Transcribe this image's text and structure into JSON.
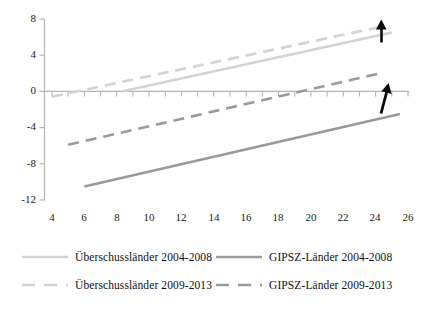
{
  "chart_data": {
    "type": "line",
    "title": "",
    "subtitle": "",
    "xlabel": "",
    "ylabel": "",
    "xlim": [
      3,
      27
    ],
    "ylim": [
      -12,
      8
    ],
    "xticks": [
      4,
      6,
      8,
      10,
      12,
      14,
      16,
      18,
      20,
      22,
      24,
      26
    ],
    "yticks": [
      8,
      4,
      0,
      -4,
      -8,
      -12
    ],
    "xtick_labels": [
      "4",
      "6",
      "8",
      "10",
      "12",
      "14",
      "16",
      "18",
      "20",
      "22",
      "24",
      "26"
    ],
    "ytick_labels": [
      "8",
      "4",
      "0",
      "-4",
      "-8",
      "-12"
    ],
    "grid": false,
    "legend_position": "bottom",
    "zero_line": true,
    "series": [
      {
        "name": "Überschussländer 2004-2008",
        "style": "solid",
        "color": "#d3d3d3",
        "x": [
          8.3,
          25.0
        ],
        "values": [
          0.0,
          6.5
        ]
      },
      {
        "name": "GIPSZ-Länder 2004-2008",
        "style": "solid",
        "color": "#9a9a9a",
        "x": [
          6.0,
          25.5
        ],
        "values": [
          -10.5,
          -2.5
        ]
      },
      {
        "name": "Überschussländer 2009-2013",
        "style": "dashed",
        "color": "#d3d3d3",
        "x": [
          4.0,
          24.5
        ],
        "values": [
          -0.6,
          7.2
        ]
      },
      {
        "name": "GIPSZ-Länder 2009-2013",
        "style": "dashed",
        "color": "#9a9a9a",
        "x": [
          5.0,
          24.5
        ],
        "values": [
          -5.9,
          2.1
        ]
      }
    ],
    "annotations": [
      {
        "name": "up-arrow-upper",
        "x": 25.7,
        "y": 6.6,
        "symbol": "↑"
      },
      {
        "name": "up-arrow-lower",
        "x": 25.3,
        "y": 0.3,
        "symbol": "↑"
      }
    ]
  },
  "legend": {
    "rows": [
      [
        {
          "label": "Überschussländer 2004-2008",
          "style": "solid",
          "color": "#d3d3d3"
        },
        {
          "label": "GIPSZ-Länder 2004-2008",
          "style": "solid",
          "color": "#9a9a9a"
        }
      ],
      [
        {
          "label": "Überschussländer 2009-2013",
          "style": "dashed",
          "color": "#d3d3d3"
        },
        {
          "label": "GIPSZ-Länder 2009-2013",
          "style": "dashed",
          "color": "#9a9a9a"
        }
      ]
    ]
  },
  "axes": {
    "axis_color": "#b5b5b5",
    "text_color": "#1a1a1a"
  }
}
